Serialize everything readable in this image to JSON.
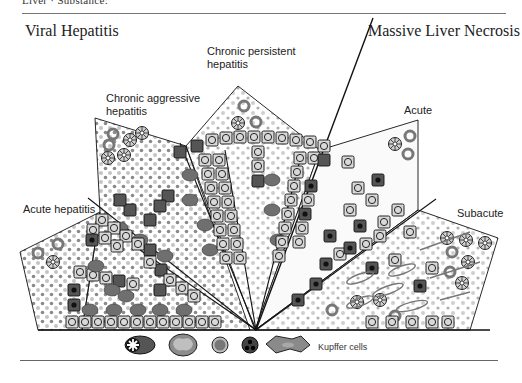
{
  "header": {
    "running_title": "Liver · Substance:"
  },
  "titles": {
    "left": "Viral Hepatitis",
    "right": "Massive Liver Necrosis"
  },
  "sector_labels": {
    "acute_hepatitis": "Acute hepatitis",
    "chronic_aggressive": [
      "Chronic aggressive",
      "hepatitis"
    ],
    "chronic_persistent": [
      "Chronic persistent",
      "hepatitis"
    ],
    "acute": "Acute",
    "subacute": "Subacute"
  },
  "legend": {
    "items": [
      {
        "name": "plasma-cell",
        "color": "#555555"
      },
      {
        "name": "macrophage",
        "color": "#9a9a9a"
      },
      {
        "name": "lymphocyte",
        "color": "#777777"
      },
      {
        "name": "granulocyte",
        "color": "#444444"
      },
      {
        "name": "kupffer-cell",
        "color": "#888888"
      }
    ],
    "kupffer_label": "Kupffer cells"
  },
  "colors": {
    "hepatocyte_fill": "#d9d9d9",
    "necrotic_fill": "#5a5a5a",
    "infiltrate_dark": "#6f6f6f",
    "infiltrate_light": "#bdbdbd",
    "outline": "#111111"
  }
}
